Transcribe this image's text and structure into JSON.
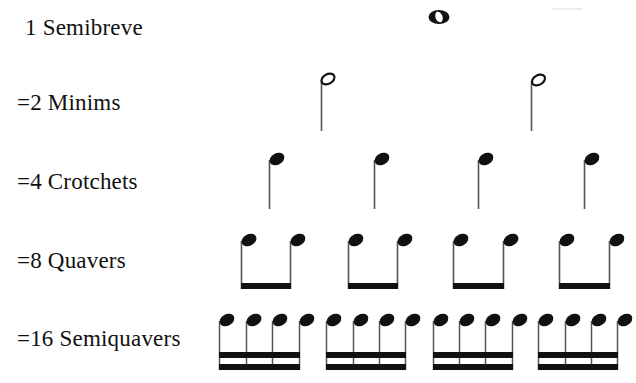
{
  "rows": [
    {
      "label": "1 Semibreve",
      "count": 1,
      "note": "semibreve"
    },
    {
      "label": "=2 Minims",
      "count": 2,
      "note": "minim"
    },
    {
      "label": "=4 Crotchets",
      "count": 4,
      "note": "crotchet"
    },
    {
      "label": "=8 Quavers",
      "count": 8,
      "note": "quaver"
    },
    {
      "label": "=16 Semiquavers",
      "count": 16,
      "note": "semiquaver"
    }
  ],
  "colors": {
    "ink": "#111111",
    "stem": "#555555",
    "background": "#ffffff"
  }
}
